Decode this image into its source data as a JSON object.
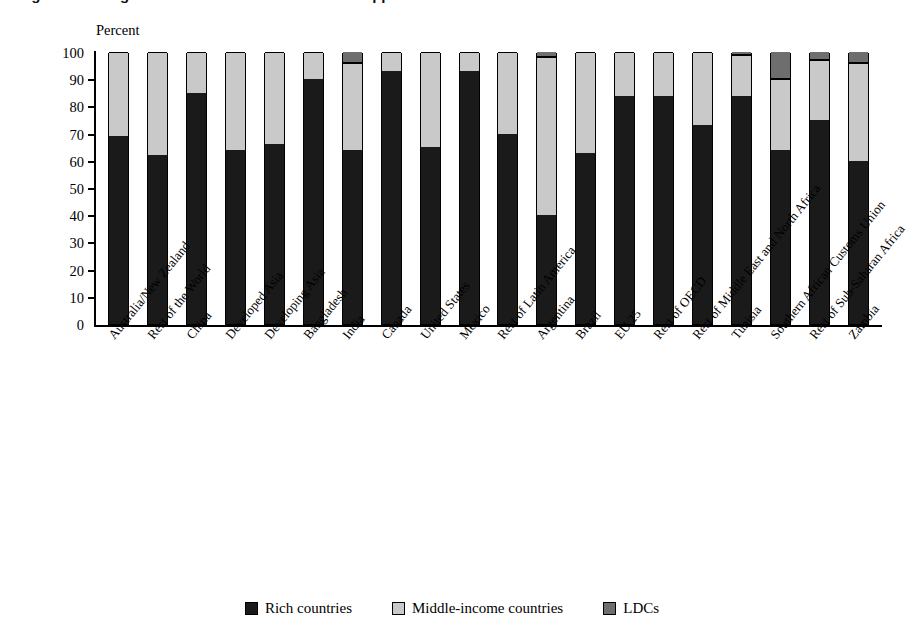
{
  "figure": {
    "title": "Figure 5. Who gains from removal of textiles and apparel tariffs?"
  },
  "axis": {
    "y_title": "Percent",
    "y_ticks": [
      "100",
      "90",
      "80",
      "70",
      "60",
      "50",
      "40",
      "30",
      "20",
      "10",
      "0"
    ]
  },
  "legend": {
    "items": [
      {
        "label": "Rich countries",
        "color": "#1a1a1a"
      },
      {
        "label": "Middle-income countries",
        "color": "#c9c9c9"
      },
      {
        "label": "LDCs",
        "color": "#6e6e6e"
      }
    ]
  },
  "chart_data": {
    "type": "bar",
    "stacked": true,
    "title": "Figure 5. Who gains from removal of textiles and apparel tariffs?",
    "xlabel": "",
    "ylabel": "Percent",
    "ylim": [
      0,
      100
    ],
    "grid": false,
    "legend_position": "bottom",
    "categories": [
      "Australia/New Zealand",
      "Rest of the World",
      "China",
      "Developed Asia",
      "Developing Asia",
      "Bangladesh",
      "India",
      "Canada",
      "United States",
      "Mexico",
      "Rest of Latin America",
      "Argentina",
      "Brazil",
      "EU 25",
      "Rest of OECD",
      "Rest of Middle East and North Africa",
      "Tunisia",
      "Southern African Customs Union",
      "Rest of Sub-Saharan Africa",
      "Zambia"
    ],
    "series": [
      {
        "name": "Rich countries",
        "color": "#1a1a1a",
        "values": [
          69,
          62,
          85,
          64,
          66,
          90,
          64,
          93,
          65,
          93,
          70,
          40,
          63,
          84,
          84,
          73,
          84,
          64,
          75,
          60
        ]
      },
      {
        "name": "Middle-income countries",
        "color": "#c9c9c9",
        "values": [
          31,
          38,
          15,
          36,
          34,
          10,
          32,
          7,
          35,
          7,
          30,
          58,
          37,
          16,
          16,
          27,
          15,
          26,
          22,
          36
        ]
      },
      {
        "name": "LDCs",
        "color": "#6e6e6e",
        "values": [
          0,
          0,
          0,
          0,
          0,
          0,
          4,
          0,
          0,
          0,
          0,
          2,
          0,
          0,
          0,
          0,
          1,
          10,
          3,
          4
        ]
      }
    ]
  }
}
